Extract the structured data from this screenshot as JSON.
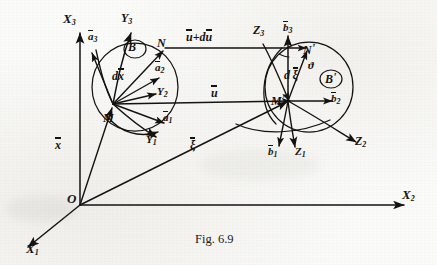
{
  "figure": {
    "caption": "Fig. 6.9",
    "ink_color": "#13110f",
    "background_color": "#fbfbf9"
  },
  "global_axes": {
    "x1": "X",
    "x1_sub": "1",
    "x2": "X",
    "x2_sub": "2",
    "x3": "X",
    "x3_sub": "3",
    "origin": "O"
  },
  "reference_config": {
    "body_label": "B",
    "point_m": "M",
    "point_n": "N",
    "position_vector": "x",
    "differential": "dx",
    "basis": [
      {
        "symbol": "a",
        "sub": "1"
      },
      {
        "symbol": "a",
        "sub": "2"
      },
      {
        "symbol": "a",
        "sub": "3"
      }
    ],
    "curvilinear_axes": [
      {
        "symbol": "Y",
        "sub": "1"
      },
      {
        "symbol": "Y",
        "sub": "2"
      },
      {
        "symbol": "Y",
        "sub": "3"
      }
    ]
  },
  "deformed_config": {
    "body_label": "B",
    "body_prime": "'",
    "point_m": "M",
    "point_m_prime": "'",
    "point_n": "N",
    "point_n_prime": "'",
    "position_vector": "ξ",
    "differential_d": "d",
    "differential_xi": "ξ",
    "angle": "ϑ",
    "basis": [
      {
        "symbol": "b",
        "sub": "1"
      },
      {
        "symbol": "b",
        "sub": "2"
      },
      {
        "symbol": "b",
        "sub": "3"
      }
    ],
    "curvilinear_axes": [
      {
        "symbol": "Z",
        "sub": "1"
      },
      {
        "symbol": "Z",
        "sub": "2"
      },
      {
        "symbol": "Z",
        "sub": "3"
      }
    ]
  },
  "displacement": {
    "u": "u",
    "u_plus_du": "u+du",
    "u_plus_du_parts": {
      "u": "u",
      "plus": "+",
      "d": "d",
      "u2": "u"
    }
  }
}
